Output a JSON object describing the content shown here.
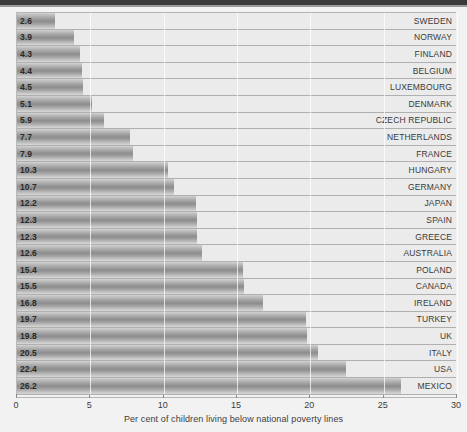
{
  "chart_data": {
    "type": "bar",
    "orientation": "horizontal",
    "title": "",
    "subtitle": "",
    "xlabel": "Per cent of children living below national poverty lines",
    "ylabel": "",
    "xlim": [
      0,
      30
    ],
    "xticks": [
      0,
      5,
      10,
      15,
      20,
      25,
      30
    ],
    "xtick_labels": [
      "0",
      "5",
      "10",
      "15",
      "20",
      "25",
      "30"
    ],
    "grid": true,
    "grid_axis": "x",
    "legend": false,
    "legend_position": "none",
    "value_labels_shown": true,
    "categories": [
      "SWEDEN",
      "NORWAY",
      "FINLAND",
      "BELGIUM",
      "LUXEMBOURG",
      "DENMARK",
      "CZECH REPUBLIC",
      "NETHERLANDS",
      "FRANCE",
      "HUNGARY",
      "GERMANY",
      "JAPAN",
      "SPAIN",
      "GREECE",
      "AUSTRALIA",
      "POLAND",
      "CANADA",
      "IRELAND",
      "TURKEY",
      "UK",
      "ITALY",
      "USA",
      "MEXICO"
    ],
    "values": [
      2.6,
      3.9,
      4.3,
      4.4,
      4.5,
      5.1,
      5.9,
      7.7,
      7.9,
      10.3,
      10.7,
      12.2,
      12.3,
      12.3,
      12.6,
      15.4,
      15.5,
      16.8,
      19.7,
      19.8,
      20.5,
      22.4,
      26.2
    ],
    "value_labels": [
      "2.6",
      "3.9",
      "4.3",
      "4.4",
      "4.5",
      "5.1",
      "5.9",
      "7.7",
      "7.9",
      "10.3",
      "10.7",
      "12.2",
      "12.3",
      "12.3",
      "12.6",
      "15.4",
      "15.5",
      "16.8",
      "19.7",
      "19.8",
      "20.5",
      "22.4",
      "26.2"
    ],
    "colors": {
      "bar_light": "#d2d2d2",
      "bar_dark": "#8d8d8d",
      "plot_background": "#ebebeb",
      "figure_background": "#f2f2f2",
      "gridline": "#ffffff",
      "row_separator": "#b0b0b0",
      "axis": "#8a8a8a",
      "value_text": "#2a2a2a",
      "category_text": "#3a3a3a"
    }
  }
}
